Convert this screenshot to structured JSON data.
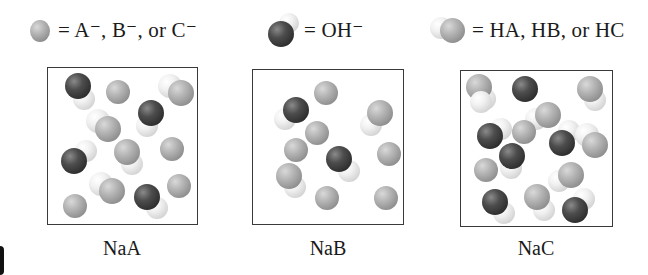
{
  "legend": [
    {
      "id": "anion",
      "symbol": "gray-sphere",
      "text": "= A⁻, B⁻, or C⁻"
    },
    {
      "id": "hydroxide",
      "symbol": "dark-white-pair",
      "text": "= OH⁻"
    },
    {
      "id": "acid",
      "symbol": "white-gray-pair",
      "text": "= HA, HB, or HC"
    }
  ],
  "colors": {
    "anion_sphere": "#a6a6a6",
    "oxygen_sphere": "#3a3a3a",
    "hydrogen_sphere": "#eeeeee",
    "box_border": "#3a3a3a",
    "background": "#ffffff"
  },
  "panels": [
    {
      "label": "NaA",
      "counts": {
        "anion": 4,
        "hydroxide": 4,
        "acid": 4
      },
      "particles": [
        {
          "type": "OH",
          "a": [
            30,
            18,
            13,
            "dark"
          ],
          "b": [
            36,
            31,
            11,
            "white"
          ]
        },
        {
          "type": "A",
          "a": [
            70,
            24,
            12,
            "gray"
          ]
        },
        {
          "type": "HA",
          "a": [
            122,
            18,
            12,
            "white"
          ],
          "b": [
            133,
            25,
            13,
            "gray"
          ]
        },
        {
          "type": "OH",
          "a": [
            103,
            45,
            13,
            "dark"
          ],
          "b": [
            99,
            58,
            11,
            "white"
          ]
        },
        {
          "type": "HA",
          "a": [
            50,
            53,
            12,
            "white"
          ],
          "b": [
            60,
            61,
            13,
            "gray"
          ]
        },
        {
          "type": "OH",
          "a": [
            26,
            93,
            13,
            "dark"
          ],
          "b": [
            38,
            83,
            11,
            "white"
          ]
        },
        {
          "type": "HA",
          "a": [
            84,
            96,
            11,
            "white"
          ],
          "b": [
            79,
            84,
            13,
            "gray"
          ]
        },
        {
          "type": "A",
          "a": [
            124,
            81,
            12,
            "gray"
          ]
        },
        {
          "type": "HA",
          "a": [
            53,
            116,
            12,
            "white"
          ],
          "b": [
            64,
            123,
            13,
            "gray"
          ]
        },
        {
          "type": "OH",
          "a": [
            99,
            129,
            13,
            "dark"
          ],
          "b": [
            109,
            140,
            11,
            "white"
          ]
        },
        {
          "type": "A",
          "a": [
            27,
            138,
            12,
            "gray"
          ]
        },
        {
          "type": "A",
          "a": [
            131,
            118,
            12,
            "gray"
          ]
        }
      ]
    },
    {
      "label": "NaB",
      "counts": {
        "anion": 8,
        "hydroxide": 2,
        "acid": 2
      },
      "particles": [
        {
          "type": "B",
          "a": [
            73,
            23,
            12,
            "gray"
          ]
        },
        {
          "type": "OH",
          "a": [
            32,
            49,
            11,
            "white"
          ],
          "b": [
            43,
            40,
            13,
            "dark"
          ]
        },
        {
          "type": "HB",
          "a": [
            118,
            55,
            11,
            "white"
          ],
          "b": [
            127,
            43,
            13,
            "gray"
          ]
        },
        {
          "type": "B",
          "a": [
            64,
            63,
            12,
            "gray"
          ]
        },
        {
          "type": "B",
          "a": [
            43,
            80,
            12,
            "gray"
          ]
        },
        {
          "type": "B",
          "a": [
            136,
            84,
            12,
            "gray"
          ]
        },
        {
          "type": "OH",
          "a": [
            86,
            89,
            13,
            "dark"
          ],
          "b": [
            96,
            101,
            11,
            "white"
          ]
        },
        {
          "type": "HB",
          "a": [
            42,
            117,
            11,
            "white"
          ],
          "b": [
            36,
            106,
            13,
            "gray"
          ]
        },
        {
          "type": "B",
          "a": [
            74,
            128,
            12,
            "gray"
          ]
        },
        {
          "type": "B",
          "a": [
            133,
            128,
            12,
            "gray"
          ]
        }
      ]
    },
    {
      "label": "NaC",
      "counts": {
        "anion": 3,
        "hydroxide": 6,
        "acid": 6
      },
      "particles": [
        {
          "type": "HC",
          "a": [
            24,
            28,
            11,
            "white"
          ],
          "b": [
            18,
            16,
            13,
            "gray"
          ]
        },
        {
          "type": "OH",
          "a": [
            20,
            31,
            11,
            "white"
          ],
          "b": [
            64,
            18,
            13,
            "dark"
          ]
        },
        {
          "type": "HC",
          "a": [
            134,
            29,
            11,
            "white"
          ],
          "b": [
            129,
            18,
            13,
            "gray"
          ]
        },
        {
          "type": "HC",
          "a": [
            75,
            48,
            11,
            "white"
          ],
          "b": [
            87,
            44,
            13,
            "gray"
          ]
        },
        {
          "type": "OH",
          "a": [
            29,
            65,
            13,
            "dark"
          ],
          "b": [
            40,
            58,
            11,
            "white"
          ]
        },
        {
          "type": "C",
          "a": [
            63,
            61,
            12,
            "gray"
          ]
        },
        {
          "type": "OH",
          "a": [
            101,
            72,
            13,
            "dark"
          ],
          "b": [
            108,
            60,
            11,
            "white"
          ]
        },
        {
          "type": "HC",
          "a": [
            126,
            64,
            12,
            "white"
          ],
          "b": [
            134,
            74,
            13,
            "gray"
          ]
        },
        {
          "type": "OH",
          "a": [
            51,
            85,
            13,
            "dark"
          ],
          "b": [
            50,
            97,
            11,
            "white"
          ]
        },
        {
          "type": "C",
          "a": [
            25,
            99,
            12,
            "gray"
          ]
        },
        {
          "type": "HC",
          "a": [
            98,
            110,
            11,
            "white"
          ],
          "b": [
            110,
            104,
            13,
            "gray"
          ]
        },
        {
          "type": "OH",
          "a": [
            34,
            131,
            13,
            "dark"
          ],
          "b": [
            43,
            142,
            11,
            "white"
          ]
        },
        {
          "type": "HC",
          "a": [
            83,
            139,
            11,
            "white"
          ],
          "b": [
            76,
            126,
            13,
            "gray"
          ]
        },
        {
          "type": "OH",
          "a": [
            114,
            139,
            13,
            "dark"
          ],
          "b": [
            123,
            128,
            11,
            "white"
          ]
        }
      ]
    }
  ]
}
